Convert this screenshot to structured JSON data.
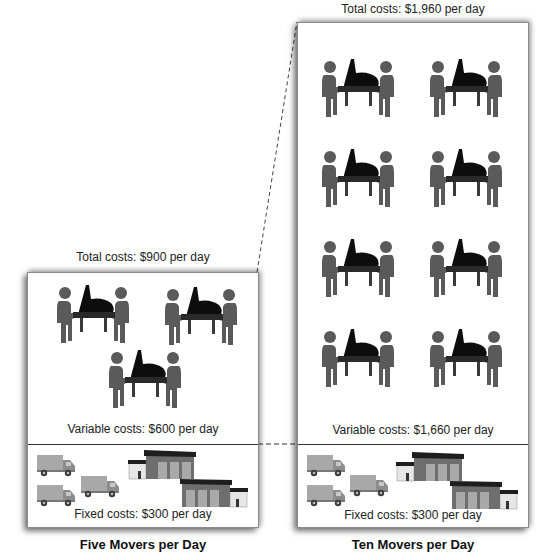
{
  "left_panel": {
    "total_label": "Total costs: $900 per day",
    "variable_label": "Variable costs: $600 per day",
    "fixed_label": "Fixed costs: $300 per day",
    "caption": "Five Movers per Day",
    "mover_teams": 3,
    "trucks": 3,
    "warehouses": 2
  },
  "right_panel": {
    "total_label": "Total costs: $1,960 per day",
    "variable_label": "Variable costs: $1,660 per day",
    "fixed_label": "Fixed costs: $300 per day",
    "caption": "Ten Movers per Day",
    "mover_teams": 8,
    "trucks": 3,
    "warehouses": 2
  },
  "icons": {
    "mover": "piano-movers-icon",
    "truck": "truck-icon",
    "warehouse": "warehouse-icon"
  },
  "colors": {
    "person": "#5a5a5a",
    "piano": "#0d0d0d",
    "truck_body": "#a8a8a8",
    "truck_cab": "#8c8c8c",
    "wheel": "#3a3a3a",
    "warehouse_wall": "#6e6e6e",
    "warehouse_roof": "#1e1e1e",
    "warehouse_door": "#a9a9a9"
  }
}
